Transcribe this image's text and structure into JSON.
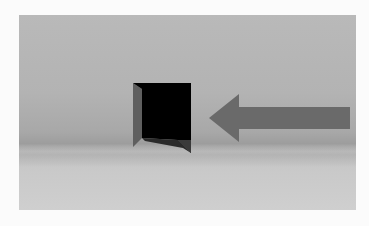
{
  "scene": {
    "description": "3D render of a dark doorway opening with a gray arrow pointing left toward it",
    "colors": {
      "frame": "#fbfbfb",
      "background_wall": "#b5b5b5",
      "floor": "#c9c9c9",
      "door_opening": "#000000",
      "door_side": "#5e5e5e",
      "arrow": "#6b6b6b"
    },
    "objects": [
      {
        "name": "doorway",
        "icon": "door-icon"
      },
      {
        "name": "arrow",
        "icon": "arrow-left-icon",
        "direction": "left"
      }
    ]
  }
}
